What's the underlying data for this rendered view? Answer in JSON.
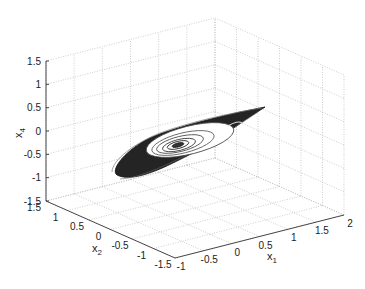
{
  "chart_data": {
    "type": "line3d",
    "title": "",
    "xlabel": "x1",
    "ylabel": "x2",
    "zlabel": "x4",
    "xlim": [
      -1,
      2
    ],
    "ylim": [
      -1.5,
      1.5
    ],
    "zlim": [
      -1.5,
      1.5
    ],
    "x_ticks": [
      "-1",
      "-0.5",
      "0",
      "0.5",
      "1",
      "1.5",
      "2"
    ],
    "y_ticks": [
      "-1.5",
      "-1",
      "-0.5",
      "0",
      "0.5",
      "1",
      "1.5"
    ],
    "z_ticks": [
      "-1.5",
      "-1",
      "-0.5",
      "0",
      "0.5",
      "1",
      "1.5"
    ],
    "grid": true,
    "legend": null,
    "series": [
      {
        "name": "trajectory",
        "color": "#222222",
        "shape": "elongated dense band with inner concentric spirals, tip pointing toward x1≈2"
      }
    ]
  },
  "axes": {
    "x_label": "x",
    "x_sub": "1",
    "y_label": "x",
    "y_sub": "2",
    "z_label": "x",
    "z_sub": "4"
  }
}
